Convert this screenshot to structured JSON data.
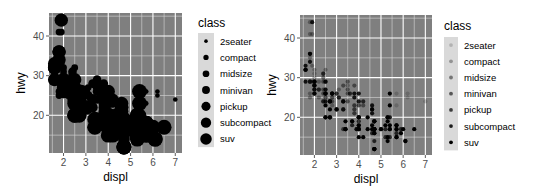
{
  "chart_data": [
    {
      "type": "scatter",
      "title": "",
      "xlabel": "displ",
      "ylabel": "hwy",
      "xlim": [
        1.6,
        7.0
      ],
      "ylim": [
        12,
        44
      ],
      "xticks": [
        2,
        3,
        4,
        5,
        6,
        7
      ],
      "yticks": [
        20,
        30,
        40
      ],
      "grid": true,
      "panel_background": "#7f7f7f",
      "point_color": "#000000",
      "aesthetic": "size",
      "legend": {
        "title": "class",
        "position": "right",
        "entries": [
          "2seater",
          "compact",
          "midsize",
          "minivan",
          "pickup",
          "subcompact",
          "suv"
        ],
        "sizes": [
          1.5,
          2.2,
          2.8,
          3.3,
          3.8,
          4.3,
          4.8
        ]
      }
    },
    {
      "type": "scatter",
      "title": "",
      "xlabel": "displ",
      "ylabel": "hwy",
      "xlim": [
        1.6,
        7.0
      ],
      "ylim": [
        12,
        44
      ],
      "xticks": [
        2,
        3,
        4,
        5,
        6,
        7
      ],
      "yticks": [
        20,
        30,
        40
      ],
      "grid": true,
      "panel_background": "#7f7f7f",
      "point_color": "#000000",
      "aesthetic": "alpha",
      "legend": {
        "title": "class",
        "position": "right",
        "entries": [
          "2seater",
          "compact",
          "midsize",
          "minivan",
          "pickup",
          "subcompact",
          "suv"
        ],
        "alphas": [
          0.18,
          0.32,
          0.46,
          0.6,
          0.73,
          0.87,
          1.0
        ]
      }
    }
  ],
  "points": [
    {
      "displ": 1.8,
      "hwy": 29,
      "class": "compact"
    },
    {
      "displ": 1.8,
      "hwy": 29,
      "class": "compact"
    },
    {
      "displ": 2.0,
      "hwy": 31,
      "class": "compact"
    },
    {
      "displ": 2.0,
      "hwy": 30,
      "class": "compact"
    },
    {
      "displ": 2.8,
      "hwy": 26,
      "class": "compact"
    },
    {
      "displ": 2.8,
      "hwy": 26,
      "class": "compact"
    },
    {
      "displ": 3.1,
      "hwy": 27,
      "class": "compact"
    },
    {
      "displ": 1.8,
      "hwy": 26,
      "class": "compact"
    },
    {
      "displ": 1.8,
      "hwy": 25,
      "class": "compact"
    },
    {
      "displ": 2.0,
      "hwy": 28,
      "class": "compact"
    },
    {
      "displ": 2.0,
      "hwy": 27,
      "class": "compact"
    },
    {
      "displ": 2.8,
      "hwy": 25,
      "class": "compact"
    },
    {
      "displ": 2.8,
      "hwy": 25,
      "class": "compact"
    },
    {
      "displ": 3.1,
      "hwy": 25,
      "class": "compact"
    },
    {
      "displ": 3.1,
      "hwy": 25,
      "class": "midsize"
    },
    {
      "displ": 2.8,
      "hwy": 24,
      "class": "midsize"
    },
    {
      "displ": 3.1,
      "hwy": 25,
      "class": "midsize"
    },
    {
      "displ": 4.2,
      "hwy": 23,
      "class": "midsize"
    },
    {
      "displ": 5.3,
      "hwy": 20,
      "class": "suv"
    },
    {
      "displ": 5.3,
      "hwy": 15,
      "class": "suv"
    },
    {
      "displ": 5.3,
      "hwy": 20,
      "class": "suv"
    },
    {
      "displ": 5.7,
      "hwy": 17,
      "class": "suv"
    },
    {
      "displ": 6.0,
      "hwy": 17,
      "class": "suv"
    },
    {
      "displ": 5.7,
      "hwy": 26,
      "class": "2seater"
    },
    {
      "displ": 5.7,
      "hwy": 23,
      "class": "2seater"
    },
    {
      "displ": 6.2,
      "hwy": 26,
      "class": "2seater"
    },
    {
      "displ": 6.2,
      "hwy": 25,
      "class": "2seater"
    },
    {
      "displ": 7.0,
      "hwy": 24,
      "class": "2seater"
    },
    {
      "displ": 5.3,
      "hwy": 19,
      "class": "suv"
    },
    {
      "displ": 5.3,
      "hwy": 14,
      "class": "suv"
    },
    {
      "displ": 5.7,
      "hwy": 15,
      "class": "suv"
    },
    {
      "displ": 6.5,
      "hwy": 17,
      "class": "suv"
    },
    {
      "displ": 2.4,
      "hwy": 24,
      "class": "midsize"
    },
    {
      "displ": 3.0,
      "hwy": 22,
      "class": "midsize"
    },
    {
      "displ": 3.3,
      "hwy": 22,
      "class": "midsize"
    },
    {
      "displ": 3.3,
      "hwy": 24,
      "class": "midsize"
    },
    {
      "displ": 3.3,
      "hwy": 24,
      "class": "midsize"
    },
    {
      "displ": 3.3,
      "hwy": 22,
      "class": "midsize"
    },
    {
      "displ": 2.4,
      "hwy": 24,
      "class": "minivan"
    },
    {
      "displ": 3.0,
      "hwy": 22,
      "class": "minivan"
    },
    {
      "displ": 3.3,
      "hwy": 22,
      "class": "minivan"
    },
    {
      "displ": 3.3,
      "hwy": 24,
      "class": "minivan"
    },
    {
      "displ": 3.3,
      "hwy": 24,
      "class": "minivan"
    },
    {
      "displ": 3.3,
      "hwy": 17,
      "class": "minivan"
    },
    {
      "displ": 3.8,
      "hwy": 22,
      "class": "minivan"
    },
    {
      "displ": 3.8,
      "hwy": 21,
      "class": "minivan"
    },
    {
      "displ": 3.8,
      "hwy": 23,
      "class": "minivan"
    },
    {
      "displ": 4.0,
      "hwy": 23,
      "class": "minivan"
    },
    {
      "displ": 3.7,
      "hwy": 19,
      "class": "pickup"
    },
    {
      "displ": 3.7,
      "hwy": 18,
      "class": "pickup"
    },
    {
      "displ": 3.9,
      "hwy": 17,
      "class": "pickup"
    },
    {
      "displ": 3.9,
      "hwy": 17,
      "class": "pickup"
    },
    {
      "displ": 4.7,
      "hwy": 19,
      "class": "pickup"
    },
    {
      "displ": 4.7,
      "hwy": 19,
      "class": "pickup"
    },
    {
      "displ": 4.7,
      "hwy": 12,
      "class": "pickup"
    },
    {
      "displ": 5.2,
      "hwy": 17,
      "class": "pickup"
    },
    {
      "displ": 5.2,
      "hwy": 15,
      "class": "pickup"
    },
    {
      "displ": 5.7,
      "hwy": 17,
      "class": "pickup"
    },
    {
      "displ": 5.9,
      "hwy": 17,
      "class": "pickup"
    },
    {
      "displ": 4.7,
      "hwy": 12,
      "class": "suv"
    },
    {
      "displ": 4.7,
      "hwy": 17,
      "class": "suv"
    },
    {
      "displ": 4.7,
      "hwy": 16,
      "class": "suv"
    },
    {
      "displ": 5.2,
      "hwy": 18,
      "class": "suv"
    },
    {
      "displ": 5.7,
      "hwy": 15,
      "class": "suv"
    },
    {
      "displ": 5.9,
      "hwy": 16,
      "class": "suv"
    },
    {
      "displ": 4.7,
      "hwy": 12,
      "class": "suv"
    },
    {
      "displ": 4.7,
      "hwy": 17,
      "class": "suv"
    },
    {
      "displ": 4.7,
      "hwy": 17,
      "class": "suv"
    },
    {
      "displ": 4.7,
      "hwy": 16,
      "class": "suv"
    },
    {
      "displ": 5.7,
      "hwy": 18,
      "class": "suv"
    },
    {
      "displ": 6.1,
      "hwy": 14,
      "class": "suv"
    },
    {
      "displ": 4.0,
      "hwy": 20,
      "class": "suv"
    },
    {
      "displ": 4.2,
      "hwy": 15,
      "class": "suv"
    },
    {
      "displ": 4.4,
      "hwy": 20,
      "class": "suv"
    },
    {
      "displ": 4.6,
      "hwy": 17,
      "class": "suv"
    },
    {
      "displ": 5.4,
      "hwy": 17,
      "class": "suv"
    },
    {
      "displ": 5.4,
      "hwy": 26,
      "class": "suv"
    },
    {
      "displ": 5.4,
      "hwy": 23,
      "class": "suv"
    },
    {
      "displ": 4.0,
      "hwy": 17,
      "class": "pickup"
    },
    {
      "displ": 4.0,
      "hwy": 17,
      "class": "pickup"
    },
    {
      "displ": 4.0,
      "hwy": 17,
      "class": "pickup"
    },
    {
      "displ": 4.0,
      "hwy": 17,
      "class": "pickup"
    },
    {
      "displ": 4.6,
      "hwy": 16,
      "class": "pickup"
    },
    {
      "displ": 5.0,
      "hwy": 17,
      "class": "pickup"
    },
    {
      "displ": 5.4,
      "hwy": 17,
      "class": "pickup"
    },
    {
      "displ": 5.4,
      "hwy": 15,
      "class": "pickup"
    },
    {
      "displ": 3.8,
      "hwy": 26,
      "class": "subcompact"
    },
    {
      "displ": 3.8,
      "hwy": 25,
      "class": "subcompact"
    },
    {
      "displ": 4.0,
      "hwy": 26,
      "class": "subcompact"
    },
    {
      "displ": 4.0,
      "hwy": 24,
      "class": "subcompact"
    },
    {
      "displ": 4.6,
      "hwy": 21,
      "class": "subcompact"
    },
    {
      "displ": 4.6,
      "hwy": 22,
      "class": "subcompact"
    },
    {
      "displ": 4.6,
      "hwy": 23,
      "class": "subcompact"
    },
    {
      "displ": 4.6,
      "hwy": 22,
      "class": "subcompact"
    },
    {
      "displ": 5.4,
      "hwy": 20,
      "class": "subcompact"
    },
    {
      "displ": 1.6,
      "hwy": 33,
      "class": "subcompact"
    },
    {
      "displ": 1.6,
      "hwy": 32,
      "class": "subcompact"
    },
    {
      "displ": 1.6,
      "hwy": 32,
      "class": "subcompact"
    },
    {
      "displ": 1.6,
      "hwy": 29,
      "class": "subcompact"
    },
    {
      "displ": 1.6,
      "hwy": 32,
      "class": "subcompact"
    },
    {
      "displ": 1.8,
      "hwy": 34,
      "class": "subcompact"
    },
    {
      "displ": 1.8,
      "hwy": 36,
      "class": "subcompact"
    },
    {
      "displ": 1.8,
      "hwy": 36,
      "class": "subcompact"
    },
    {
      "displ": 2.0,
      "hwy": 29,
      "class": "subcompact"
    },
    {
      "displ": 2.4,
      "hwy": 26,
      "class": "midsize"
    },
    {
      "displ": 2.4,
      "hwy": 27,
      "class": "midsize"
    },
    {
      "displ": 2.4,
      "hwy": 30,
      "class": "midsize"
    },
    {
      "displ": 2.4,
      "hwy": 31,
      "class": "midsize"
    },
    {
      "displ": 2.5,
      "hwy": 26,
      "class": "midsize"
    },
    {
      "displ": 2.5,
      "hwy": 26,
      "class": "midsize"
    },
    {
      "displ": 3.3,
      "hwy": 28,
      "class": "midsize"
    },
    {
      "displ": 2.0,
      "hwy": 26,
      "class": "subcompact"
    },
    {
      "displ": 2.0,
      "hwy": 29,
      "class": "subcompact"
    },
    {
      "displ": 2.0,
      "hwy": 28,
      "class": "subcompact"
    },
    {
      "displ": 2.0,
      "hwy": 27,
      "class": "subcompact"
    },
    {
      "displ": 2.7,
      "hwy": 24,
      "class": "subcompact"
    },
    {
      "displ": 2.7,
      "hwy": 24,
      "class": "subcompact"
    },
    {
      "displ": 2.7,
      "hwy": 24,
      "class": "subcompact"
    },
    {
      "displ": 3.0,
      "hwy": 22,
      "class": "suv"
    },
    {
      "displ": 3.7,
      "hwy": 19,
      "class": "suv"
    },
    {
      "displ": 4.0,
      "hwy": 20,
      "class": "suv"
    },
    {
      "displ": 4.7,
      "hwy": 17,
      "class": "suv"
    },
    {
      "displ": 4.7,
      "hwy": 12,
      "class": "suv"
    },
    {
      "displ": 4.7,
      "hwy": 19,
      "class": "suv"
    },
    {
      "displ": 5.7,
      "hwy": 18,
      "class": "suv"
    },
    {
      "displ": 6.1,
      "hwy": 14,
      "class": "suv"
    },
    {
      "displ": 4.0,
      "hwy": 15,
      "class": "suv"
    },
    {
      "displ": 4.0,
      "hwy": 18,
      "class": "suv"
    },
    {
      "displ": 4.6,
      "hwy": 18,
      "class": "suv"
    },
    {
      "displ": 5.0,
      "hwy": 17,
      "class": "suv"
    },
    {
      "displ": 1.8,
      "hwy": 29,
      "class": "compact"
    },
    {
      "displ": 1.8,
      "hwy": 29,
      "class": "compact"
    },
    {
      "displ": 2.0,
      "hwy": 28,
      "class": "compact"
    },
    {
      "displ": 2.0,
      "hwy": 29,
      "class": "compact"
    },
    {
      "displ": 2.8,
      "hwy": 26,
      "class": "compact"
    },
    {
      "displ": 2.8,
      "hwy": 26,
      "class": "compact"
    },
    {
      "displ": 3.6,
      "hwy": 26,
      "class": "midsize"
    },
    {
      "displ": 2.5,
      "hwy": 26,
      "class": "compact"
    },
    {
      "displ": 2.5,
      "hwy": 25,
      "class": "compact"
    },
    {
      "displ": 2.5,
      "hwy": 27,
      "class": "compact"
    },
    {
      "displ": 2.5,
      "hwy": 25,
      "class": "compact"
    },
    {
      "displ": 2.2,
      "hwy": 27,
      "class": "compact"
    },
    {
      "displ": 2.2,
      "hwy": 25,
      "class": "compact"
    },
    {
      "displ": 2.5,
      "hwy": 23,
      "class": "suv"
    },
    {
      "displ": 2.5,
      "hwy": 20,
      "class": "suv"
    },
    {
      "displ": 2.5,
      "hwy": 20,
      "class": "suv"
    },
    {
      "displ": 2.5,
      "hwy": 26,
      "class": "subcompact"
    },
    {
      "displ": 2.5,
      "hwy": 27,
      "class": "subcompact"
    },
    {
      "displ": 2.5,
      "hwy": 26,
      "class": "subcompact"
    },
    {
      "displ": 2.5,
      "hwy": 24,
      "class": "subcompact"
    },
    {
      "displ": 2.7,
      "hwy": 20,
      "class": "suv"
    },
    {
      "displ": 2.7,
      "hwy": 22,
      "class": "suv"
    },
    {
      "displ": 3.4,
      "hwy": 17,
      "class": "suv"
    },
    {
      "displ": 3.4,
      "hwy": 19,
      "class": "suv"
    },
    {
      "displ": 4.0,
      "hwy": 20,
      "class": "suv"
    },
    {
      "displ": 4.7,
      "hwy": 17,
      "class": "suv"
    },
    {
      "displ": 2.2,
      "hwy": 29,
      "class": "compact"
    },
    {
      "displ": 2.2,
      "hwy": 27,
      "class": "compact"
    },
    {
      "displ": 2.4,
      "hwy": 31,
      "class": "compact"
    },
    {
      "displ": 2.4,
      "hwy": 31,
      "class": "compact"
    },
    {
      "displ": 3.0,
      "hwy": 26,
      "class": "compact"
    },
    {
      "displ": 3.0,
      "hwy": 26,
      "class": "compact"
    },
    {
      "displ": 3.5,
      "hwy": 28,
      "class": "compact"
    },
    {
      "displ": 2.2,
      "hwy": 27,
      "class": "midsize"
    },
    {
      "displ": 2.4,
      "hwy": 29,
      "class": "midsize"
    },
    {
      "displ": 3.0,
      "hwy": 26,
      "class": "midsize"
    },
    {
      "displ": 3.5,
      "hwy": 29,
      "class": "midsize"
    },
    {
      "displ": 1.8,
      "hwy": 44,
      "class": "compact"
    },
    {
      "displ": 1.8,
      "hwy": 41,
      "class": "compact"
    },
    {
      "displ": 1.8,
      "hwy": 35,
      "class": "compact"
    },
    {
      "displ": 2.0,
      "hwy": 29,
      "class": "compact"
    },
    {
      "displ": 2.8,
      "hwy": 23,
      "class": "compact"
    },
    {
      "displ": 1.9,
      "hwy": 44,
      "class": "subcompact"
    },
    {
      "displ": 2.0,
      "hwy": 26,
      "class": "subcompact"
    },
    {
      "displ": 2.0,
      "hwy": 28,
      "class": "subcompact"
    },
    {
      "displ": 2.5,
      "hwy": 29,
      "class": "subcompact"
    },
    {
      "displ": 2.8,
      "hwy": 26,
      "class": "subcompact"
    },
    {
      "displ": 1.9,
      "hwy": 33,
      "class": "compact"
    },
    {
      "displ": 2.0,
      "hwy": 27,
      "class": "compact"
    },
    {
      "displ": 2.5,
      "hwy": 29,
      "class": "compact"
    },
    {
      "displ": 2.8,
      "hwy": 26,
      "class": "compact"
    },
    {
      "displ": 1.9,
      "hwy": 41,
      "class": "compact"
    },
    {
      "displ": 1.9,
      "hwy": 29,
      "class": "compact"
    },
    {
      "displ": 2.0,
      "hwy": 32,
      "class": "compact"
    },
    {
      "displ": 2.5,
      "hwy": 29,
      "class": "compact"
    },
    {
      "displ": 1.8,
      "hwy": 29,
      "class": "midsize"
    },
    {
      "displ": 2.0,
      "hwy": 29,
      "class": "midsize"
    },
    {
      "displ": 2.8,
      "hwy": 26,
      "class": "midsize"
    },
    {
      "displ": 3.6,
      "hwy": 26,
      "class": "midsize"
    },
    {
      "displ": 4.2,
      "hwy": 24,
      "class": "pickup"
    },
    {
      "displ": 4.7,
      "hwy": 19,
      "class": "pickup"
    },
    {
      "displ": 4.7,
      "hwy": 14,
      "class": "pickup"
    },
    {
      "displ": 5.7,
      "hwy": 16,
      "class": "pickup"
    },
    {
      "displ": 2.7,
      "hwy": 20,
      "class": "pickup"
    },
    {
      "displ": 2.7,
      "hwy": 20,
      "class": "pickup"
    },
    {
      "displ": 3.4,
      "hwy": 17,
      "class": "pickup"
    },
    {
      "displ": 3.4,
      "hwy": 17,
      "class": "pickup"
    },
    {
      "displ": 4.0,
      "hwy": 18,
      "class": "pickup"
    },
    {
      "displ": 4.0,
      "hwy": 19,
      "class": "pickup"
    },
    {
      "displ": 4.7,
      "hwy": 17,
      "class": "suv"
    },
    {
      "displ": 5.4,
      "hwy": 18,
      "class": "suv"
    },
    {
      "displ": 4.4,
      "hwy": 17,
      "class": "suv"
    },
    {
      "displ": 3.5,
      "hwy": 24,
      "class": "midsize"
    },
    {
      "displ": 3.5,
      "hwy": 26,
      "class": "midsize"
    },
    {
      "displ": 3.5,
      "hwy": 27,
      "class": "midsize"
    },
    {
      "displ": 2.5,
      "hwy": 32,
      "class": "compact"
    },
    {
      "displ": 3.8,
      "hwy": 28,
      "class": "midsize"
    }
  ],
  "classes": [
    "2seater",
    "compact",
    "midsize",
    "minivan",
    "pickup",
    "subcompact",
    "suv"
  ]
}
